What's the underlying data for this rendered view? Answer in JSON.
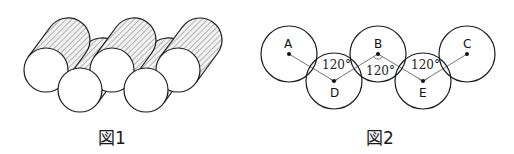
{
  "figure1": {
    "caption": "図1",
    "description": "Five cylinders arranged in a staggered zigzag, with hatched side surfaces"
  },
  "figure2": {
    "caption": "図2",
    "points": [
      {
        "id": "A",
        "label": "A"
      },
      {
        "id": "D",
        "label": "D"
      },
      {
        "id": "B",
        "label": "B"
      },
      {
        "id": "E",
        "label": "E"
      },
      {
        "id": "C",
        "label": "C"
      }
    ],
    "angles": [
      {
        "at": "D",
        "label": "120°"
      },
      {
        "at": "B",
        "label": "120°"
      },
      {
        "at": "E",
        "label": "120°"
      }
    ]
  },
  "colors": {
    "stroke": "#1a1a1a",
    "hatch": "#555555",
    "link": "#666666"
  }
}
